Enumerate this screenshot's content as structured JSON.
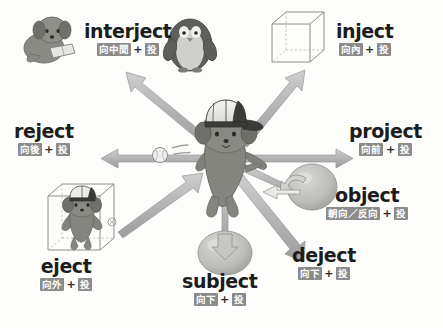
{
  "diagram": {
    "root_word": "ject",
    "center_character": "dog-with-baseball-cap",
    "arrow_color": "#b0b0b0",
    "chip_color": "#8b8b8b",
    "word_color": "#1c1c1c",
    "plus_symbol": "+",
    "separator_symbol": "／"
  },
  "entries": [
    {
      "id": "interject",
      "word": "interject",
      "prefix_gloss": "向中間",
      "root_gloss": "投",
      "direction": "upper-left",
      "illustration": "dog-reading-book-and-penguin"
    },
    {
      "id": "inject",
      "word": "inject",
      "prefix_gloss": "向內",
      "root_gloss": "投",
      "direction": "upper-right",
      "illustration": "wireframe-cube-arrow-in"
    },
    {
      "id": "reject",
      "word": "reject",
      "prefix_gloss": "向後",
      "root_gloss": "投",
      "direction": "left",
      "illustration": "baseball-thrown-backward"
    },
    {
      "id": "project",
      "word": "project",
      "prefix_gloss": "向前",
      "root_gloss": "投",
      "direction": "right",
      "illustration": "arrow-forward"
    },
    {
      "id": "object",
      "word": "object",
      "prefix_gloss": "朝向／反向",
      "root_gloss": "投",
      "direction": "lower-right-near",
      "illustration": "sphere-with-rebound-arrow"
    },
    {
      "id": "deject",
      "word": "deject",
      "prefix_gloss": "向下",
      "root_gloss": "投",
      "direction": "lower-right",
      "illustration": "arrow-down-right"
    },
    {
      "id": "subject",
      "word": "subject",
      "prefix_gloss": "向下",
      "root_gloss": "投",
      "direction": "down",
      "illustration": "sphere-arrow-down-into"
    },
    {
      "id": "eject",
      "word": "eject",
      "prefix_gloss": "向外",
      "root_gloss": "投",
      "direction": "lower-left",
      "illustration": "dog-inside-wireframe-cube-arrow-out"
    }
  ]
}
